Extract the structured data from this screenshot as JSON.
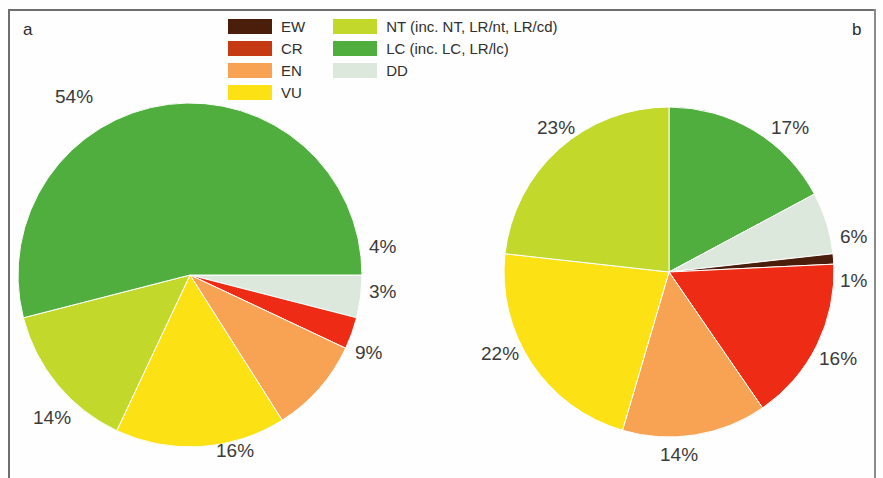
{
  "figure": {
    "panel_a_label": "a",
    "panel_b_label": "b"
  },
  "legend": {
    "columns": [
      {
        "entries": [
          {
            "label": "EW",
            "color": "#4a1e0a"
          },
          {
            "label": "CR",
            "color": "#c53a12"
          },
          {
            "label": "EN",
            "color": "#f8a254"
          },
          {
            "label": "VU",
            "color": "#fce114"
          }
        ]
      },
      {
        "entries": [
          {
            "label": "NT (inc. NT, LR/nt, LR/cd)",
            "color": "#c2d92b"
          },
          {
            "label": "LC (inc. LC, LR/lc)",
            "color": "#4fae3d"
          },
          {
            "label": "DD",
            "color": "#dce8dc"
          }
        ]
      }
    ]
  },
  "colors": {
    "EW": "#4a1e0a",
    "CR": "#ee2b14",
    "EN": "#f8a254",
    "VU": "#fce114",
    "NT": "#c2d92b",
    "LC": "#4fae3d",
    "DD": "#dce8dc"
  },
  "chart_data": [
    {
      "type": "pie",
      "title": "a",
      "panel": "a",
      "start_angle_deg": 0,
      "direction": "clockwise",
      "categories": [
        "DD",
        "CR",
        "EN",
        "VU",
        "NT",
        "LC"
      ],
      "values": [
        4,
        3,
        9,
        16,
        14,
        54
      ],
      "labels": [
        "4%",
        "3%",
        "9%",
        "16%",
        "14%",
        "54%"
      ],
      "unit": "percent",
      "legend_position": "top-center-shared"
    },
    {
      "type": "pie",
      "title": "b",
      "panel": "b",
      "start_angle_deg": -90,
      "direction": "clockwise",
      "categories": [
        "LC",
        "DD",
        "EW",
        "CR",
        "EN",
        "VU",
        "NT"
      ],
      "values": [
        17,
        6,
        1,
        16,
        14,
        22,
        23
      ],
      "labels": [
        "17%",
        "6%",
        "1%",
        "16%",
        "14%",
        "22%",
        "23%"
      ],
      "unit": "percent",
      "legend_position": "top-center-shared"
    }
  ],
  "pie_a_labels": {
    "lc": "54%",
    "dd": "4%",
    "cr": "3%",
    "en": "9%",
    "vu": "16%",
    "nt": "14%"
  },
  "pie_b_labels": {
    "lc": "17%",
    "dd": "6%",
    "ew": "1%",
    "cr": "16%",
    "en": "14%",
    "vu": "22%",
    "nt": "23%"
  }
}
